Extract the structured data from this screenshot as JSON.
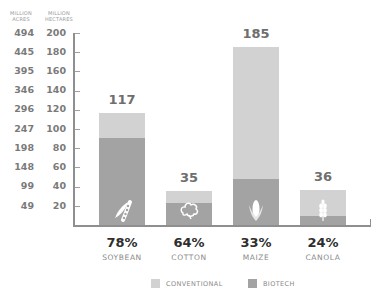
{
  "colors": {
    "conventional": "#d2d2d2",
    "biotech": "#a3a3a3",
    "axis": "#8f8f8f"
  },
  "axes": {
    "left_header": "MILLION ACRES",
    "right_header": "MILLION HECTARES",
    "acres_ticks": [
      "494",
      "445",
      "395",
      "346",
      "296",
      "247",
      "198",
      "148",
      "99",
      "49"
    ],
    "hectare_ticks": [
      "200",
      "180",
      "160",
      "140",
      "120",
      "100",
      "80",
      "60",
      "40",
      "20"
    ]
  },
  "legend": {
    "conventional": "CONVENTIONAL",
    "biotech": "BIOTECH"
  },
  "chart_data": {
    "type": "bar",
    "stacked": true,
    "title": "",
    "xlabel": "",
    "ylabel": "Million hectares (left: million acres)",
    "ylim": [
      0,
      200
    ],
    "yticks_hectares": [
      20,
      40,
      60,
      80,
      100,
      120,
      140,
      160,
      180,
      200
    ],
    "yticks_acres": [
      49,
      99,
      148,
      198,
      247,
      296,
      346,
      395,
      445,
      494
    ],
    "categories": [
      "SOYBEAN",
      "COTTON",
      "MAIZE",
      "CANOLA"
    ],
    "totals": [
      117,
      35,
      185,
      36
    ],
    "biotech_percent": [
      "78%",
      "64%",
      "33%",
      "24%"
    ],
    "series": [
      {
        "name": "BIOTECH",
        "values": [
          91,
          23,
          48,
          9
        ]
      },
      {
        "name": "CONVENTIONAL",
        "values": [
          26,
          12,
          137,
          27
        ]
      }
    ],
    "legend_position": "bottom",
    "grid": false
  },
  "bars": [
    {
      "label": "SOYBEAN",
      "total": "117",
      "pct": "78%",
      "icon": "soybean-icon"
    },
    {
      "label": "COTTON",
      "total": "35",
      "pct": "64%",
      "icon": "cotton-icon"
    },
    {
      "label": "MAIZE",
      "total": "185",
      "pct": "33%",
      "icon": "maize-icon"
    },
    {
      "label": "CANOLA",
      "total": "36",
      "pct": "24%",
      "icon": "canola-icon"
    }
  ]
}
